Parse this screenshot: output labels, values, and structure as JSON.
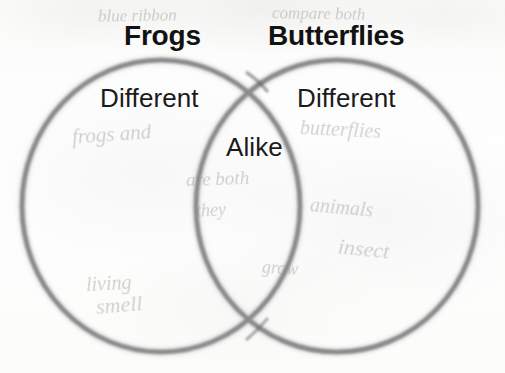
{
  "worksheet": {
    "type": "venn-diagram",
    "width": 505,
    "height": 373,
    "background_color": "#fdfdfc",
    "stroke_color": "#8a8a8a",
    "text_color": "#121212"
  },
  "headings": [
    {
      "id": "left",
      "label": "Frogs",
      "x": 124,
      "y": 20,
      "font_size": 28
    },
    {
      "id": "right",
      "label": "Butterflies",
      "x": 268,
      "y": 20,
      "font_size": 28
    }
  ],
  "regions": [
    {
      "id": "left-only",
      "label": "Different",
      "x": 100,
      "y": 83,
      "font_size": 26
    },
    {
      "id": "right-only",
      "label": "Different",
      "x": 297,
      "y": 83,
      "font_size": 26
    },
    {
      "id": "overlap",
      "label": "Alike",
      "x": 226,
      "y": 132,
      "font_size": 26
    }
  ],
  "circles": [
    {
      "id": "left-circle",
      "cx": 161,
      "cy": 206,
      "rx": 139,
      "ry": 146
    },
    {
      "id": "right-circle",
      "cx": 337,
      "cy": 206,
      "rx": 141,
      "ry": 146
    }
  ],
  "background_ghosts": [
    {
      "text": "frogs and",
      "x": 72,
      "y": 122,
      "size": 21,
      "rot": -4
    },
    {
      "text": "butterflies",
      "x": 300,
      "y": 118,
      "size": 20,
      "rot": 3
    },
    {
      "text": "are both",
      "x": 186,
      "y": 168,
      "size": 19,
      "rot": -2
    },
    {
      "text": "they",
      "x": 196,
      "y": 200,
      "size": 18,
      "rot": -3
    },
    {
      "text": "animals",
      "x": 310,
      "y": 196,
      "size": 20,
      "rot": 5
    },
    {
      "text": "insect",
      "x": 338,
      "y": 236,
      "size": 22,
      "rot": 6
    },
    {
      "text": "living",
      "x": 86,
      "y": 272,
      "size": 20,
      "rot": -3
    },
    {
      "text": "grow",
      "x": 262,
      "y": 258,
      "size": 18,
      "rot": 4
    },
    {
      "text": "smell",
      "x": 96,
      "y": 292,
      "size": 22,
      "rot": -5
    },
    {
      "text": "blue ribbon",
      "x": 98,
      "y": 6,
      "size": 17,
      "rot": -1
    },
    {
      "text": "compare both",
      "x": 272,
      "y": 4,
      "size": 17,
      "rot": 1
    }
  ]
}
